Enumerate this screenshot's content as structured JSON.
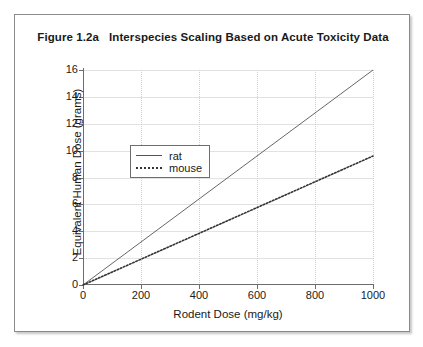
{
  "chart_data": {
    "type": "line",
    "title": "Figure 1.2a   Interspecies Scaling Based on Acute Toxicity Data",
    "xlabel": "Rodent Dose (mg/kg)",
    "ylabel": "Equivalent Human Dose (grams)",
    "xlim": [
      0,
      1000
    ],
    "ylim": [
      0,
      16
    ],
    "xticks": [
      0,
      200,
      400,
      600,
      800,
      1000
    ],
    "yticks": [
      0,
      2,
      4,
      6,
      8,
      10,
      12,
      14,
      16
    ],
    "xtick_labels": [
      "0",
      "200",
      "400",
      "600",
      "800",
      "1000"
    ],
    "ytick_labels": [
      "0",
      "2",
      "4",
      "6",
      "8",
      "10",
      "12",
      "14",
      "16"
    ],
    "grid": true,
    "grid_style": "horizontal solid light, vertical dotted light",
    "legend_position": "upper left inside plot",
    "series": [
      {
        "name": "rat",
        "style": "solid",
        "color": "#555555",
        "x": [
          0,
          200,
          400,
          600,
          800,
          1000
        ],
        "values": [
          0,
          3.2,
          6.4,
          9.6,
          12.8,
          16.0
        ]
      },
      {
        "name": "mouse",
        "style": "dotted",
        "color": "#333333",
        "x": [
          0,
          200,
          400,
          600,
          800,
          1000
        ],
        "values": [
          0,
          1.92,
          3.84,
          5.76,
          7.68,
          9.6
        ]
      }
    ]
  },
  "legend": {
    "entries": [
      {
        "label": "rat"
      },
      {
        "label": "mouse"
      }
    ]
  }
}
